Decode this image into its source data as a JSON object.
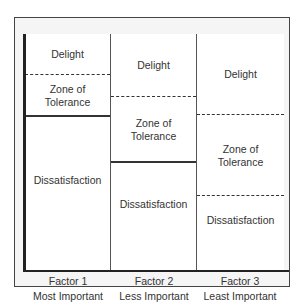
{
  "diagram": {
    "columns": [
      {
        "factor": "Factor 1",
        "importance": "Most Important",
        "zones": [
          {
            "label_lines": [
              "Delight"
            ]
          },
          {
            "label_lines": [
              "Zone of",
              "Tolerance"
            ]
          },
          {
            "label_lines": [
              "Dissatisfaction"
            ]
          }
        ]
      },
      {
        "factor": "Factor 2",
        "importance": "Less Important",
        "zones": [
          {
            "label_lines": [
              "Delight"
            ]
          },
          {
            "label_lines": [
              "Zone of",
              "Tolerance"
            ]
          },
          {
            "label_lines": [
              "Dissatisfaction"
            ]
          }
        ]
      },
      {
        "factor": "Factor 3",
        "importance": "Least Important",
        "zones": [
          {
            "label_lines": [
              "Delight"
            ]
          },
          {
            "label_lines": [
              "Zone of",
              "Tolerance"
            ]
          },
          {
            "label_lines": [
              "Dissatisfaction"
            ]
          }
        ]
      }
    ]
  }
}
